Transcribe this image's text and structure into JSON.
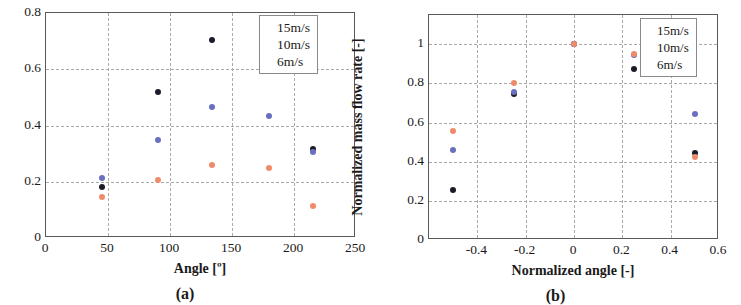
{
  "figure": {
    "panels": [
      {
        "id": "a",
        "caption": "(a)",
        "xlabel": "Angle [º]",
        "ylabel": "Mass flow rate [kg/s]"
      },
      {
        "id": "b",
        "caption": "(b)",
        "xlabel": "Normalized angle [-]",
        "ylabel": "Normalized mass flow rate [-]"
      }
    ]
  },
  "colors": {
    "s15": "#1b1b2a",
    "s10": "#6b6fc0",
    "s6": "#ef8b6a",
    "grid": "#aaa9a9",
    "frame": "#5a5a5a"
  },
  "chart_data": [
    {
      "type": "scatter",
      "panel": "(a)",
      "title": "",
      "xlabel": "Angle [º]",
      "ylabel": "Mass flow rate [kg/s]",
      "xlim": [
        0,
        250
      ],
      "ylim": [
        0,
        0.8
      ],
      "xticks": [
        0,
        50,
        100,
        150,
        200,
        250
      ],
      "xtick_labels": [
        "0",
        "50",
        "100",
        "150",
        "200",
        "250"
      ],
      "yticks": [
        0,
        0.2,
        0.4,
        0.6,
        0.8
      ],
      "ytick_labels": [
        "0",
        "0.2",
        "0.4",
        "0.6",
        "0.8"
      ],
      "grid": true,
      "legend_position": "top-right",
      "series": [
        {
          "name": "15m/s",
          "color": "#1b1b2a",
          "x": [
            45,
            90,
            134,
            180,
            215
          ],
          "y": [
            0.18,
            0.52,
            0.705,
            0.61,
            0.315
          ]
        },
        {
          "name": "10m/s",
          "color": "#6b6fc0",
          "x": [
            45,
            90,
            134,
            180,
            215
          ],
          "y": [
            0.215,
            0.35,
            0.465,
            0.435,
            0.305
          ]
        },
        {
          "name": "6m/s",
          "color": "#ef8b6a",
          "x": [
            45,
            90,
            134,
            180,
            215
          ],
          "y": [
            0.145,
            0.208,
            0.26,
            0.25,
            0.115
          ]
        }
      ]
    },
    {
      "type": "scatter",
      "panel": "(b)",
      "title": "",
      "xlabel": "Normalized angle [-]",
      "ylabel": "Normalized mass flow rate [-]",
      "xlim": [
        -0.6,
        0.6
      ],
      "ylim": [
        0,
        1.15
      ],
      "xticks": [
        -0.4,
        -0.2,
        0,
        0.2,
        0.4,
        0.6
      ],
      "xtick_labels": [
        "-0.4",
        "-0.2",
        "0",
        "0.2",
        "0.4",
        "0.6"
      ],
      "yticks": [
        0,
        0.2,
        0.4,
        0.6,
        0.8,
        1
      ],
      "ytick_labels": [
        "0",
        "0.2",
        "0.4",
        "0.6",
        "0.8",
        "1"
      ],
      "grid": true,
      "legend_position": "top-right",
      "series": [
        {
          "name": "15m/s",
          "color": "#1b1b2a",
          "x": [
            -0.5,
            -0.25,
            0,
            0.25,
            0.5
          ],
          "y": [
            0.255,
            0.745,
            1.0,
            0.875,
            0.445
          ]
        },
        {
          "name": "10m/s",
          "color": "#6b6fc0",
          "x": [
            -0.5,
            -0.25,
            0,
            0.25,
            0.5
          ],
          "y": [
            0.46,
            0.755,
            1.0,
            0.945,
            0.645
          ]
        },
        {
          "name": "6m/s",
          "color": "#ef8b6a",
          "x": [
            -0.5,
            -0.25,
            0,
            0.25,
            0.5
          ],
          "y": [
            0.555,
            0.8,
            1.0,
            0.95,
            0.425
          ]
        }
      ]
    }
  ],
  "legend": {
    "a": [
      "15m/s",
      "10m/s",
      "6m/s"
    ],
    "b": [
      "15m/s",
      "10m/s",
      "6m/s"
    ]
  }
}
